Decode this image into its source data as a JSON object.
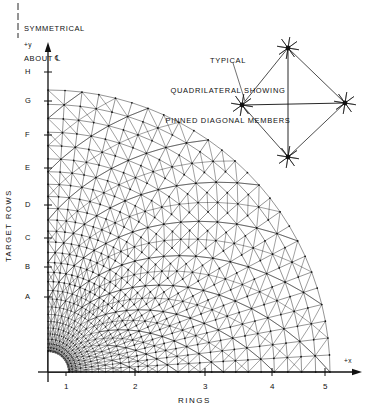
{
  "figure": {
    "kind": "finite-element-mesh-diagram",
    "symmetry_note": {
      "line1": "SYMMETRICAL",
      "line2": "ABOUT ℄"
    },
    "inset_title": {
      "line1": "TYPICAL",
      "line2": "QUADRILATERAL SHOWING",
      "line3": "PINNED DIAGONAL MEMBERS"
    },
    "axes": {
      "x_axis_label": "+x",
      "y_axis_label": "+y",
      "x_title": "RINGS",
      "y_title": "TARGET ROWS",
      "x_ticks": [
        "1",
        "2",
        "3",
        "4",
        "5"
      ],
      "y_ticks": [
        "A",
        "B",
        "C",
        "D",
        "E",
        "F",
        "G",
        "H"
      ]
    },
    "colors": {
      "ink": "#111111",
      "mesh": "#1c1c1c",
      "background": "#ffffff"
    }
  },
  "chart_data": {
    "type": "mesh",
    "title": "TYPICAL QUADRILATERAL SHOWING PINNED DIAGONAL MEMBERS",
    "xlabel": "RINGS",
    "ylabel": "TARGET ROWS",
    "x_tick_values": [
      1,
      2,
      3,
      4,
      5
    ],
    "y_tick_values": [
      "A",
      "B",
      "C",
      "D",
      "E",
      "F",
      "G",
      "H"
    ],
    "grid": false,
    "mesh": {
      "rings": 28,
      "radial_divisions": 26,
      "inner_radius_px": 20,
      "outer_radius_px": 282,
      "quarter_sector_degrees": 90,
      "origin_px": [
        48,
        372
      ],
      "x_tick_px": [
        66,
        135,
        205,
        272,
        325
      ],
      "y_tick_px": [
        297,
        267,
        238,
        205,
        168,
        135,
        101,
        72
      ]
    },
    "inset_quadrilateral": {
      "nodes": [
        {
          "name": "top",
          "x": 288,
          "y": 48
        },
        {
          "name": "right",
          "x": 345,
          "y": 103
        },
        {
          "name": "bottom",
          "x": 288,
          "y": 157
        },
        {
          "name": "left",
          "x": 242,
          "y": 105
        }
      ],
      "edges": [
        [
          "top",
          "right"
        ],
        [
          "right",
          "bottom"
        ],
        [
          "bottom",
          "left"
        ],
        [
          "left",
          "top"
        ]
      ],
      "diagonals": [
        [
          "top",
          "bottom"
        ],
        [
          "left",
          "right"
        ]
      ],
      "node_marker": "starburst"
    }
  }
}
